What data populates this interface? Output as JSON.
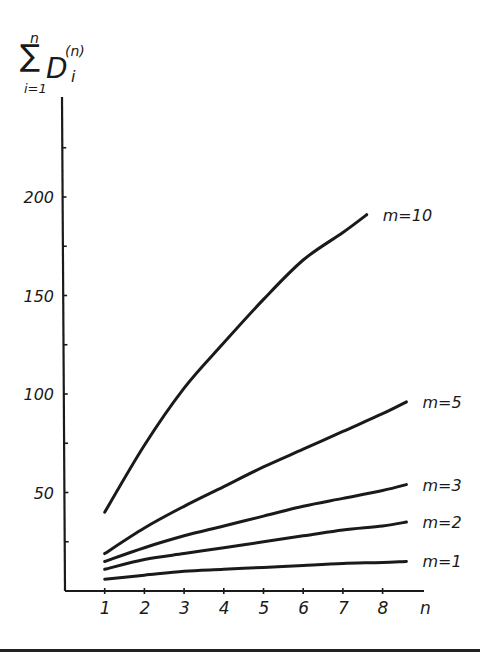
{
  "chart_data": {
    "type": "line",
    "title": "",
    "ylabel": "Σ_{i=1}^{n} D_i^(n)",
    "ylabel_parts": {
      "sigma": "∑",
      "upper": "n",
      "lower": "i=1",
      "body": "D",
      "sup": "(n)",
      "sub": "i"
    },
    "xlabel": "n",
    "xlim": [
      0,
      9
    ],
    "ylim": [
      0,
      240
    ],
    "x_ticks": [
      1,
      2,
      3,
      4,
      5,
      6,
      7,
      8
    ],
    "x_tick_labels": [
      "1",
      "2",
      "3",
      "4",
      "5",
      "6",
      "7",
      "8"
    ],
    "y_ticks_labeled": [
      50,
      100,
      150,
      200
    ],
    "y_tick_labels": [
      "50",
      "100",
      "150",
      "200"
    ],
    "y_minor_ticks": [
      25,
      75,
      125,
      175,
      225
    ],
    "grid": false,
    "legend": "inline labels at line ends",
    "series": [
      {
        "name": "m=10",
        "x": [
          1,
          2,
          3,
          4,
          5,
          6,
          7,
          7.6
        ],
        "values": [
          40,
          74,
          103,
          126,
          148,
          168,
          182,
          191
        ]
      },
      {
        "name": "m=5",
        "x": [
          1,
          2,
          3,
          4,
          5,
          6,
          7,
          8,
          8.6
        ],
        "values": [
          19,
          32,
          43,
          53,
          63,
          72,
          81,
          90,
          96
        ]
      },
      {
        "name": "m=3",
        "x": [
          1,
          2,
          3,
          4,
          5,
          6,
          7,
          8,
          8.6
        ],
        "values": [
          15,
          22,
          28,
          33,
          38,
          43,
          47,
          51,
          54
        ]
      },
      {
        "name": "m=2",
        "x": [
          1,
          2,
          3,
          4,
          5,
          6,
          7,
          8,
          8.6
        ],
        "values": [
          11,
          16,
          19,
          22,
          25,
          28,
          31,
          33,
          35
        ]
      },
      {
        "name": "m=1",
        "x": [
          1,
          2,
          3,
          4,
          5,
          6,
          7,
          8,
          8.6
        ],
        "values": [
          6,
          8,
          10,
          11,
          12,
          13,
          14,
          14.5,
          15
        ]
      }
    ]
  },
  "colors": {
    "ink": "#1a1a1a",
    "background": "#ffffff"
  }
}
